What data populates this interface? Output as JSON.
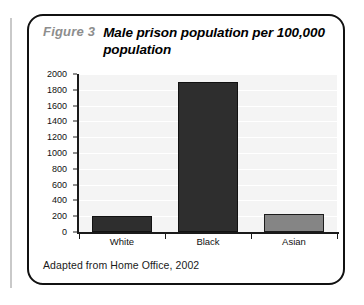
{
  "figure": {
    "number": "Figure 3",
    "title": "Male prison population per 100,000 population",
    "source": "Adapted from Home Office, 2002"
  },
  "chart_data": {
    "type": "bar",
    "title": "Male prison population per 100,000 population",
    "xlabel": "",
    "ylabel": "",
    "categories": [
      "White",
      "Black",
      "Asian"
    ],
    "values": [
      200,
      1900,
      230
    ],
    "ylim": [
      0,
      2000
    ],
    "yticks": [
      0,
      200,
      400,
      600,
      800,
      1000,
      1200,
      1400,
      1600,
      1800,
      2000
    ],
    "ytick_labels": [
      "0",
      "200",
      "400",
      "600",
      "800",
      "1000",
      "1200",
      "1400",
      "1600",
      "1800",
      "2000"
    ],
    "grid": true,
    "legend": false,
    "bar_colors": [
      "#2e2e2e",
      "#2e2e2e",
      "#858585"
    ],
    "plot_background": "#f4f4f4",
    "axis_color": "#1a1a1a"
  },
  "colors": {
    "figure_number": "#8d8d8d",
    "title_text": "#000000",
    "box_border": "#111111",
    "margin_rule": "#c9c9c9"
  }
}
